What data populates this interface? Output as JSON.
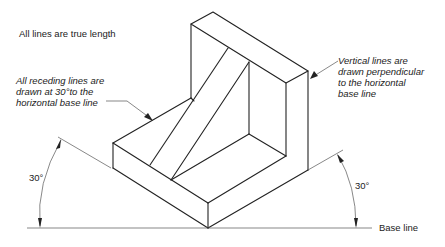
{
  "diagram": {
    "title_note": "All lines are true length",
    "left_note": {
      "lines": [
        "All receding lines are",
        "drawn at 30°to the",
        "horizontal base line"
      ]
    },
    "right_note": {
      "lines": [
        "Vertical lines are",
        "drawn perpendicular",
        "to the horizontal",
        "base line"
      ]
    },
    "left_angle_label": "30°",
    "right_angle_label": "30°",
    "baseline_label": "Base line",
    "colors": {
      "line": "#222222",
      "background": "#ffffff"
    }
  }
}
